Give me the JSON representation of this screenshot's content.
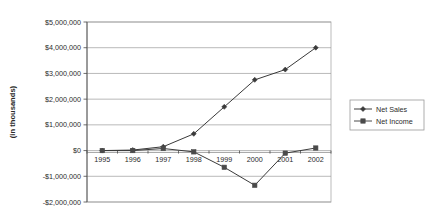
{
  "chart_data": {
    "type": "line",
    "title": "",
    "xlabel": "",
    "ylabel": "(in thousands)",
    "categories": [
      "1995",
      "1996",
      "1997",
      "1998",
      "1999",
      "2000",
      "2001",
      "2002"
    ],
    "series": [
      {
        "name": "Net Sales",
        "marker": "diamond",
        "color": "#3a3a3a",
        "values": [
          0,
          20000,
          150000,
          650000,
          1700000,
          2750000,
          3150000,
          4000000
        ]
      },
      {
        "name": "Net Income",
        "marker": "square",
        "color": "#4a4a4a",
        "values": [
          0,
          0,
          80000,
          -50000,
          -650000,
          -1350000,
          -100000,
          100000
        ]
      }
    ],
    "ylim": [
      -2000000,
      5000000
    ],
    "ytick_values": [
      5000000,
      4000000,
      3000000,
      2000000,
      1000000,
      0,
      -1000000,
      -2000000
    ],
    "ytick_labels": [
      "$5,000,000",
      "$4,000,000",
      "$3,000,000",
      "$2,000,000",
      "$1,000,000",
      "$0",
      "-$1,000,000",
      "-$2,000,000"
    ],
    "grid": true,
    "legend_position": "right"
  },
  "legend": {
    "entries": [
      {
        "label": "Net Sales",
        "marker": "diamond-marker-icon"
      },
      {
        "label": "Net Income",
        "marker": "square-marker-icon"
      }
    ]
  },
  "colors": {
    "net_sales": "#3a3a3a",
    "net_income": "#4a4a4a",
    "grid": "#9a9a9a",
    "axis": "#4a4a4a",
    "background": "#ffffff"
  }
}
